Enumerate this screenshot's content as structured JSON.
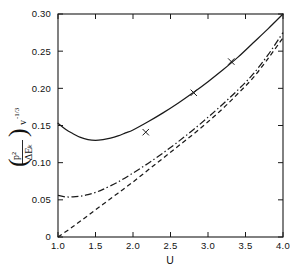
{
  "chart_data": {
    "type": "line",
    "title": "",
    "subtitle": "",
    "xlabel": "U",
    "ylabel": "( p² / ΔEₖ ) v^(-1/3)",
    "ylabel_parts": {
      "numerator": "p²",
      "denominator": "ΔEₖ",
      "outer": "v",
      "exponent": "-1/3",
      "paren_open": "(",
      "paren_close": ")"
    },
    "xlim": [
      1.0,
      4.0
    ],
    "ylim": [
      0.0,
      0.3
    ],
    "grid": false,
    "legend_position": "none",
    "xticks": [
      1.0,
      1.5,
      2.0,
      2.5,
      3.0,
      3.5,
      4.0
    ],
    "xticklabels": [
      "1.0",
      "1.5",
      "2.0",
      "2.5",
      "3.0",
      "3.5",
      "4.0"
    ],
    "yticks": [
      0.0,
      0.05,
      0.1,
      0.15,
      0.2,
      0.25,
      0.3
    ],
    "yticklabels": [
      "0",
      "0.05",
      "0.10",
      "0.15",
      "0.20",
      "0.25",
      "0.30"
    ],
    "frame": "box",
    "tick_direction": "in",
    "series": [
      {
        "name": "solid-curve",
        "style": "solid",
        "color": "#1a1a1a",
        "x": [
          1.0,
          1.1,
          1.2,
          1.3,
          1.4,
          1.5,
          1.6,
          1.7,
          1.8,
          1.9,
          2.0,
          2.2,
          2.4,
          2.6,
          2.8,
          3.0,
          3.2,
          3.4,
          3.6,
          3.8,
          4.0
        ],
        "values": [
          0.153,
          0.145,
          0.139,
          0.134,
          0.131,
          0.13,
          0.131,
          0.133,
          0.136,
          0.14,
          0.144,
          0.155,
          0.167,
          0.18,
          0.194,
          0.209,
          0.225,
          0.242,
          0.261,
          0.28,
          0.3
        ]
      },
      {
        "name": "dash-dot-curve",
        "style": "dashdot",
        "color": "#1a1a1a",
        "x": [
          1.0,
          1.1,
          1.2,
          1.3,
          1.4,
          1.5,
          1.6,
          1.8,
          2.0,
          2.2,
          2.4,
          2.6,
          2.8,
          3.0,
          3.2,
          3.4,
          3.6,
          3.8,
          4.0
        ],
        "values": [
          0.056,
          0.054,
          0.054,
          0.055,
          0.057,
          0.06,
          0.064,
          0.074,
          0.086,
          0.099,
          0.113,
          0.128,
          0.144,
          0.161,
          0.179,
          0.198,
          0.219,
          0.245,
          0.275
        ]
      },
      {
        "name": "dashed-curve",
        "style": "dashed",
        "color": "#1a1a1a",
        "x": [
          1.0,
          1.2,
          1.4,
          1.6,
          1.8,
          2.0,
          2.2,
          2.4,
          2.6,
          2.8,
          3.0,
          3.2,
          3.4,
          3.6,
          3.8,
          4.0
        ],
        "values": [
          0.0,
          0.014,
          0.029,
          0.044,
          0.059,
          0.074,
          0.09,
          0.106,
          0.122,
          0.138,
          0.155,
          0.173,
          0.193,
          0.214,
          0.24,
          0.268
        ]
      }
    ],
    "markers": {
      "name": "x-data-points",
      "symbol": "x",
      "color": "#1a1a1a",
      "points": [
        {
          "x": 2.17,
          "y": 0.141
        },
        {
          "x": 2.81,
          "y": 0.194
        },
        {
          "x": 3.31,
          "y": 0.236
        }
      ]
    }
  }
}
